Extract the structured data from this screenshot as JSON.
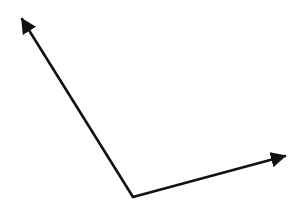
{
  "diagram": {
    "type": "two-vectors-from-common-origin",
    "background": "#ffffff",
    "stroke_color": "#111111",
    "stroke_width": 2.6,
    "origin": {
      "x": 133,
      "y": 197
    },
    "vectors": [
      {
        "name": "left-up-vector",
        "tip": {
          "x": 22,
          "y": 19
        }
      },
      {
        "name": "right-vector",
        "tip": {
          "x": 285,
          "y": 156
        }
      }
    ]
  }
}
